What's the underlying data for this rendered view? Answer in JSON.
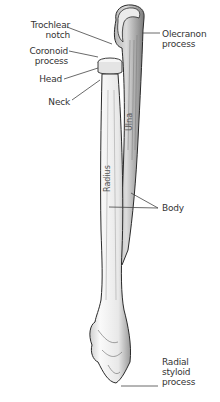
{
  "diagram": {
    "colors": {
      "background": "#ffffff",
      "bone_fill": "#f4f4f4",
      "outline": "#2a2a2a",
      "leader": "#444444",
      "text": "#333333"
    },
    "labels": {
      "trochlear_notch": "Trochlear\nnotch",
      "coronoid_process": "Coronoid\nprocess",
      "head": "Head",
      "neck": "Neck",
      "olecranon_process": "Olecranon\nprocess",
      "body": "Body",
      "radial_styloid_process": "Radial\nstyloid\nprocess"
    },
    "bone_labels": {
      "radius": "Radius",
      "ulna": "Ulna"
    }
  }
}
